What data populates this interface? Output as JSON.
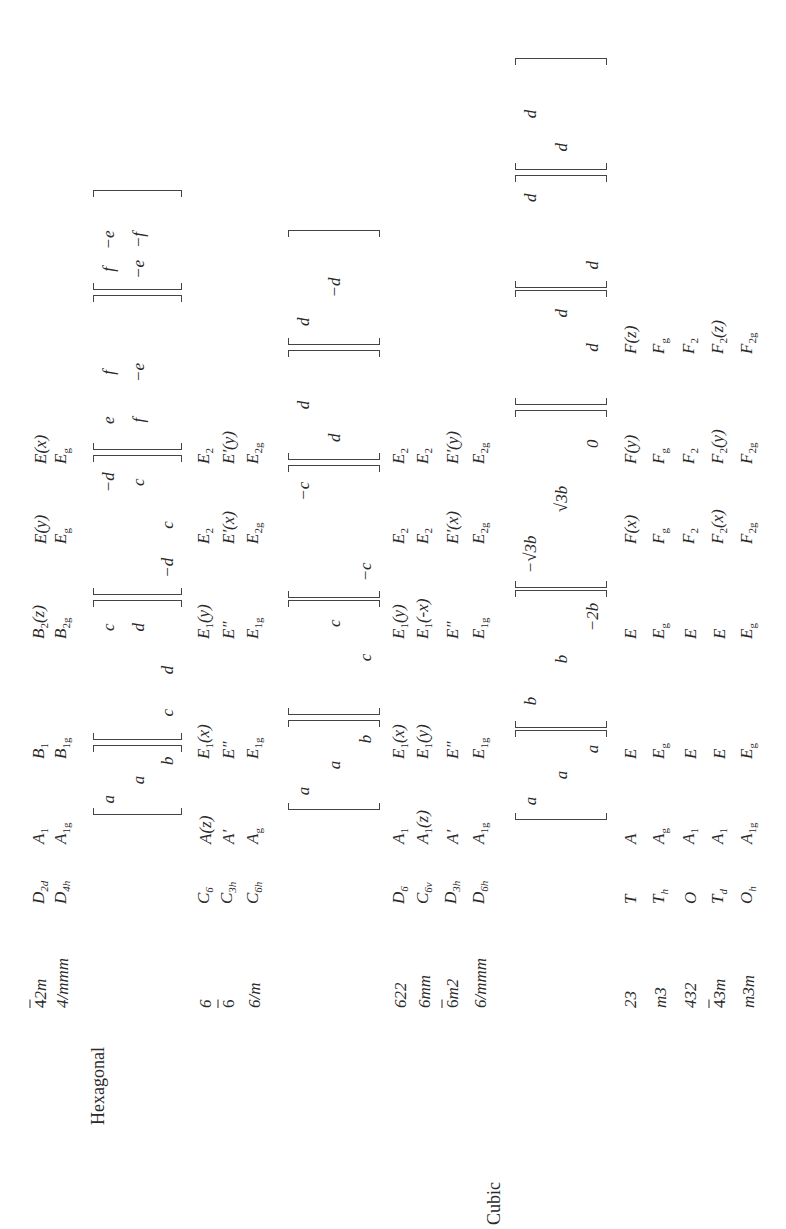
{
  "crystal_systems": [
    {
      "label": "Hexagonal",
      "x": 104,
      "y": 98
    },
    {
      "label": "Cubic",
      "x": 4,
      "y": 494
    }
  ],
  "rows": [
    {
      "symbol": "42m",
      "bar": true,
      "schoenflies": "D",
      "sub": "2d",
      "y": 40,
      "species": [
        [
          "A",
          "1"
        ],
        [
          "B",
          "1"
        ],
        [
          "B",
          "2",
          "(z)"
        ],
        [
          "E",
          "",
          "(y)"
        ],
        [
          "E",
          "",
          "(x)"
        ]
      ]
    },
    {
      "symbol": "4/mmm",
      "bar": false,
      "schoenflies": "D",
      "sub": "4h",
      "y": 62,
      "species": [
        [
          "A",
          "1g"
        ],
        [
          "B",
          "1g"
        ],
        [
          "B",
          "2g"
        ],
        [
          "E",
          "g"
        ],
        [
          "E",
          "g"
        ]
      ]
    },
    {
      "symbol": "6",
      "bar": false,
      "schoenflies": "C",
      "sub": "6",
      "y": 205,
      "species": [
        [
          "A",
          "",
          "(z)"
        ],
        [
          "E",
          "1",
          "(x)"
        ],
        [
          "E",
          "1",
          "(y)"
        ],
        [
          "E",
          "2"
        ],
        [
          "E",
          "2"
        ]
      ]
    },
    {
      "symbol": "6",
      "bar": true,
      "schoenflies": "C",
      "sub": "3h",
      "y": 228,
      "species": [
        [
          "A′",
          ""
        ],
        [
          "E″",
          ""
        ],
        [
          "E″",
          ""
        ],
        [
          "E′",
          "",
          "(x)"
        ],
        [
          "E′",
          "",
          "(y)"
        ]
      ]
    },
    {
      "symbol": "6/m",
      "bar": false,
      "schoenflies": "C",
      "sub": "6h",
      "y": 254,
      "species": [
        [
          "A",
          "g"
        ],
        [
          "E",
          "1g"
        ],
        [
          "E",
          "1g"
        ],
        [
          "E",
          "2g"
        ],
        [
          "E",
          "2g"
        ]
      ]
    },
    {
      "symbol": "622",
      "bar": false,
      "schoenflies": "D",
      "sub": "6",
      "y": 400,
      "species": [
        [
          "A",
          "1"
        ],
        [
          "E",
          "1",
          "(x)"
        ],
        [
          "E",
          "1",
          "(y)"
        ],
        [
          "E",
          "2"
        ],
        [
          "E",
          "2"
        ]
      ]
    },
    {
      "symbol": "6mm",
      "bar": false,
      "schoenflies": "C",
      "sub": "6v",
      "y": 424,
      "species": [
        [
          "A",
          "1",
          "(z)"
        ],
        [
          "E",
          "1",
          "(y)"
        ],
        [
          "E",
          "1",
          "(-x)"
        ],
        [
          "E",
          "2"
        ],
        [
          "E",
          "2"
        ]
      ]
    },
    {
      "symbol": "6m2",
      "bar": true,
      "schoenflies": "D",
      "sub": "3h",
      "y": 452,
      "species": [
        [
          "A′",
          ""
        ],
        [
          "E″",
          ""
        ],
        [
          "E″",
          ""
        ],
        [
          "E′",
          "",
          "(x)"
        ],
        [
          "E′",
          "",
          "(y)"
        ]
      ]
    },
    {
      "symbol": "6/mmm",
      "bar": false,
      "schoenflies": "D",
      "sub": "6h",
      "y": 480,
      "species": [
        [
          "A",
          "1g"
        ],
        [
          "E",
          "1g"
        ],
        [
          "E",
          "1g"
        ],
        [
          "E",
          "2g"
        ],
        [
          "E",
          "2g"
        ]
      ]
    },
    {
      "symbol": "23",
      "bar": false,
      "schoenflies": "T",
      "sub": "",
      "y": 630,
      "species": [
        [
          "A",
          ""
        ],
        [
          "E",
          ""
        ],
        [
          "E",
          ""
        ],
        [
          "F",
          "",
          "(x)"
        ],
        [
          "F",
          "",
          "(y)"
        ],
        [
          "F",
          "",
          "(z)"
        ]
      ]
    },
    {
      "symbol": "m3",
      "bar": false,
      "schoenflies": "T",
      "sub": "h",
      "y": 660,
      "species": [
        [
          "A",
          "g"
        ],
        [
          "E",
          "g"
        ],
        [
          "E",
          "g"
        ],
        [
          "F",
          "g"
        ],
        [
          "F",
          "g"
        ],
        [
          "F",
          "g"
        ]
      ]
    },
    {
      "symbol": "432",
      "bar": false,
      "schoenflies": "O",
      "sub": "",
      "y": 690,
      "species": [
        [
          "A",
          "1"
        ],
        [
          "E",
          ""
        ],
        [
          "E",
          ""
        ],
        [
          "F",
          "2"
        ],
        [
          "F",
          "2"
        ],
        [
          "F",
          "2"
        ]
      ]
    },
    {
      "symbol": "43m",
      "bar": true,
      "schoenflies": "T",
      "sub": "d",
      "y": 719,
      "species": [
        [
          "A",
          "1"
        ],
        [
          "E",
          ""
        ],
        [
          "E",
          ""
        ],
        [
          "F",
          "2",
          "(x)"
        ],
        [
          "F",
          "2",
          "(y)"
        ],
        [
          "F",
          "2",
          "(z)"
        ]
      ]
    },
    {
      "symbol": "m3m",
      "bar": false,
      "schoenflies": "O",
      "sub": "h",
      "y": 748,
      "species": [
        [
          "A",
          "1g"
        ],
        [
          "E",
          "g"
        ],
        [
          "E",
          "g"
        ],
        [
          "F",
          "2g"
        ],
        [
          "F",
          "2g"
        ],
        [
          "F",
          "2g"
        ]
      ]
    }
  ],
  "species_columns_x": [
    385,
    470,
    590,
    685,
    765,
    875
  ],
  "tensor_groups": [
    {
      "top": 93,
      "bottom": 182,
      "matrices": [
        {
          "x0": 414,
          "x1": 484,
          "cells": [
            [
              "a",
              "",
              ""
            ],
            [
              "",
              "a",
              ""
            ],
            [
              "",
              "",
              "b"
            ]
          ]
        },
        {
          "x0": 489,
          "x1": 629,
          "cells": [
            [
              "",
              "",
              "c"
            ],
            [
              "",
              "",
              "d"
            ],
            [
              "c",
              "d",
              ""
            ]
          ]
        },
        {
          "x0": 634,
          "x1": 774,
          "cells": [
            [
              "",
              "",
              "−d"
            ],
            [
              "",
              "",
              "c"
            ],
            [
              "−d",
              "c",
              ""
            ]
          ]
        },
        {
          "x0": 779,
          "x1": 934,
          "cells": [
            [
              "e",
              "f",
              ""
            ],
            [
              "f",
              "−e",
              ""
            ],
            [
              "",
              "",
              ""
            ]
          ]
        },
        {
          "x0": 939,
          "x1": 1039,
          "cells": [
            [
              "f",
              "−e",
              ""
            ],
            [
              "−e",
              "−f",
              ""
            ],
            [
              "",
              "",
              ""
            ]
          ]
        }
      ]
    },
    {
      "top": 288,
      "bottom": 380,
      "matrices": [
        {
          "x0": 419,
          "x1": 509,
          "cells": [
            [
              "a",
              "",
              ""
            ],
            [
              "",
              "a",
              ""
            ],
            [
              "",
              "",
              "b"
            ]
          ]
        },
        {
          "x0": 514,
          "x1": 629,
          "cells": [
            [
              "",
              "",
              ""
            ],
            [
              "",
              "",
              "c"
            ],
            [
              "",
              "c",
              ""
            ]
          ]
        },
        {
          "x0": 631,
          "x1": 764,
          "cells": [
            [
              "",
              "",
              "−c"
            ],
            [
              "",
              "",
              ""
            ],
            [
              "−c",
              "",
              ""
            ]
          ]
        },
        {
          "x0": 769,
          "x1": 879,
          "cells": [
            [
              "",
              "d",
              ""
            ],
            [
              "d",
              "",
              ""
            ],
            [
              "",
              "",
              ""
            ]
          ]
        },
        {
          "x0": 884,
          "x1": 999,
          "cells": [
            [
              "d",
              "",
              ""
            ],
            [
              "",
              "−d",
              ""
            ],
            [
              "",
              "",
              ""
            ]
          ]
        }
      ]
    },
    {
      "top": 515,
      "bottom": 607,
      "matrices": [
        {
          "x0": 409,
          "x1": 499,
          "cells": [
            [
              "a",
              "",
              ""
            ],
            [
              "",
              "a",
              ""
            ],
            [
              "",
              "",
              "a"
            ]
          ]
        },
        {
          "x0": 501,
          "x1": 639,
          "cells": [
            [
              "b",
              "",
              ""
            ],
            [
              "",
              "b",
              ""
            ],
            [
              "",
              "",
              "−2b"
            ]
          ]
        },
        {
          "x0": 641,
          "x1": 819,
          "cells": [
            [
              "−√3b",
              "",
              ""
            ],
            [
              "",
              "√3b",
              ""
            ],
            [
              "",
              "",
              "0"
            ]
          ]
        },
        {
          "x0": 824,
          "x1": 939,
          "cells": [
            [
              "",
              "",
              ""
            ],
            [
              "",
              "",
              "d"
            ],
            [
              "",
              "d",
              ""
            ]
          ]
        },
        {
          "x0": 941,
          "x1": 1054,
          "cells": [
            [
              "",
              "",
              "d"
            ],
            [
              "",
              "",
              ""
            ],
            [
              "d",
              "",
              ""
            ]
          ]
        },
        {
          "x0": 1059,
          "x1": 1171,
          "cells": [
            [
              "",
              "d",
              ""
            ],
            [
              "d",
              "",
              ""
            ],
            [
              "",
              "",
              ""
            ]
          ]
        }
      ]
    }
  ]
}
